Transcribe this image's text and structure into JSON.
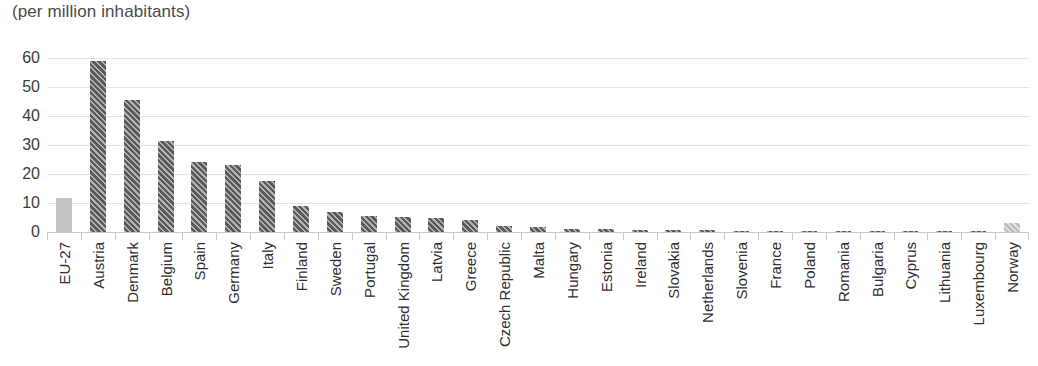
{
  "chart_data": {
    "type": "bar",
    "title": "(per million inhabitants)",
    "xlabel": "",
    "ylabel": "",
    "ylim": [
      0,
      60
    ],
    "yticks": [
      60,
      50,
      40,
      30,
      20,
      10,
      0
    ],
    "grid": true,
    "legend": "none",
    "categories": [
      "EU-27",
      "Austria",
      "Denmark",
      "Belgium",
      "Spain",
      "Germany",
      "Italy",
      "Finland",
      "Sweden",
      "Portugal",
      "United Kingdom",
      "Latvia",
      "Greece",
      "Czech Republic",
      "Malta",
      "Hungary",
      "Estonia",
      "Ireland",
      "Slovakia",
      "Netherlands",
      "Slovenia",
      "France",
      "Poland",
      "Romania",
      "Bulgaria",
      "Cyprus",
      "Lithuania",
      "Luxembourg",
      "Norway"
    ],
    "values": [
      11.8,
      59.0,
      45.5,
      31.5,
      24.0,
      23.0,
      17.5,
      9.0,
      7.0,
      5.6,
      5.3,
      5.0,
      4.1,
      2.1,
      1.7,
      1.1,
      0.9,
      0.8,
      0.7,
      0.6,
      0.4,
      0.3,
      0.25,
      0.15,
      0.1,
      0.05,
      0.05,
      0.05,
      3.1
    ],
    "bar_styles": [
      "light-solid",
      "dark",
      "dark",
      "dark",
      "dark",
      "dark",
      "dark",
      "dark",
      "dark",
      "dark",
      "dark",
      "dark",
      "dark",
      "dark",
      "dark",
      "dark",
      "dark",
      "dark",
      "dark",
      "dark",
      "dark",
      "dark",
      "dark",
      "dark",
      "dark",
      "dark",
      "dark",
      "dark",
      "light-hatch"
    ],
    "colors": {
      "bar_dark": "#5a5a5a",
      "bar_light": "#c3c3c3",
      "gridline": "#e3e3e3",
      "axis": "#c9c9c9",
      "text": "#3b3b3b",
      "title_text": "#4a4a4a"
    }
  }
}
